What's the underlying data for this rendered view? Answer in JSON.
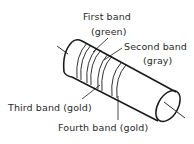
{
  "diagram": {
    "labels": {
      "first_band": "First band",
      "first_band_color": "(green)",
      "second_band": "Second band",
      "second_band_color": "(gray)",
      "third_band": "Third band (gold)",
      "fourth_band": "Fourth band (gold)"
    },
    "bands": [
      {
        "order": 1,
        "name": "First band",
        "color": "green"
      },
      {
        "order": 2,
        "name": "Second band",
        "color": "gray"
      },
      {
        "order": 3,
        "name": "Third band",
        "color": "gold"
      },
      {
        "order": 4,
        "name": "Fourth band",
        "color": "gold"
      }
    ]
  }
}
